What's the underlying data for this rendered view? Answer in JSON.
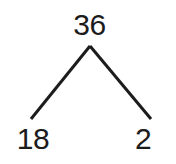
{
  "diagram": {
    "kind": "factor-tree",
    "ink_color": "#1c1c1c",
    "background_color": "#ffffff",
    "stroke_width": 3,
    "nodes": {
      "root": {
        "label": "36",
        "value": 36,
        "x": 90,
        "y": 25
      },
      "left": {
        "label": "18",
        "value": 18,
        "x": 33,
        "y": 139
      },
      "right": {
        "label": "2",
        "value": 2,
        "x": 155,
        "y": 139
      }
    },
    "edges": [
      {
        "name": "edge-root-to-left",
        "from": "root",
        "to": "left",
        "x1": 90,
        "y1": 46,
        "x2": 31,
        "y2": 119
      },
      {
        "name": "edge-root-to-right",
        "from": "root",
        "to": "right",
        "x1": 90,
        "y1": 46,
        "x2": 151,
        "y2": 119
      }
    ]
  }
}
